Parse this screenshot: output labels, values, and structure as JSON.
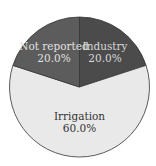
{
  "chart_data": {
    "type": "pie",
    "title": "",
    "slices": [
      {
        "label": "Industry",
        "value": 20.0,
        "display": "20.0%",
        "color": "#4b4b4b",
        "text_color": "#d8d8d8"
      },
      {
        "label": "Irrigation",
        "value": 60.0,
        "display": "60.0%",
        "color": "#e9e9e9",
        "text_color": "#333333"
      },
      {
        "label": "Not reported",
        "value": 20.0,
        "display": "20.0%",
        "color": "#5c5c5c",
        "text_color": "#e0e0e0"
      }
    ],
    "start_angle": "12 o'clock",
    "direction": "clockwise",
    "legend": "none",
    "labels_inside": true
  }
}
